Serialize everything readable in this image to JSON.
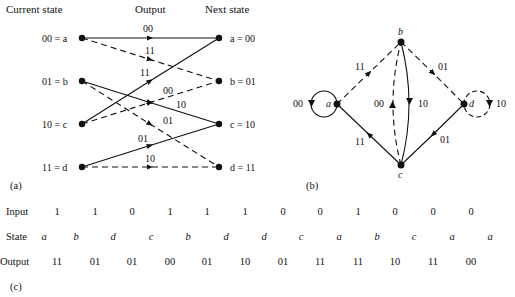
{
  "trellis": {
    "headers": {
      "current": "Current state",
      "output": "Output",
      "next": "Next state"
    },
    "left_states": [
      "00 = a",
      "01 = b",
      "10 = c",
      "11 = d"
    ],
    "right_states": [
      "a = 00",
      "b = 01",
      "c = 10",
      "d = 11"
    ],
    "edges": [
      {
        "from": "a",
        "to": "a",
        "style": "solid",
        "label": "00"
      },
      {
        "from": "a",
        "to": "b",
        "style": "dashed",
        "label": "11"
      },
      {
        "from": "b",
        "to": "c",
        "style": "solid",
        "label": "10"
      },
      {
        "from": "b",
        "to": "d",
        "style": "dashed",
        "label": "01"
      },
      {
        "from": "c",
        "to": "a",
        "style": "solid",
        "label": "11"
      },
      {
        "from": "c",
        "to": "b",
        "style": "dashed",
        "label": "00"
      },
      {
        "from": "d",
        "to": "c",
        "style": "solid",
        "label": "01"
      },
      {
        "from": "d",
        "to": "d",
        "style": "dashed",
        "label": "10"
      }
    ],
    "caption": "(a)"
  },
  "state_diagram": {
    "nodes": [
      "a",
      "b",
      "c",
      "d"
    ],
    "edges": [
      {
        "from": "a",
        "to": "a",
        "style": "solid",
        "label": "00"
      },
      {
        "from": "a",
        "to": "b",
        "style": "dashed",
        "label": "11"
      },
      {
        "from": "b",
        "to": "d",
        "style": "dashed",
        "label": "01"
      },
      {
        "from": "b",
        "to": "c",
        "style": "solid",
        "label": "10"
      },
      {
        "from": "c",
        "to": "b",
        "style": "dashed",
        "label": "00"
      },
      {
        "from": "c",
        "to": "a",
        "style": "solid",
        "label": "11"
      },
      {
        "from": "d",
        "to": "c",
        "style": "solid",
        "label": "01"
      },
      {
        "from": "d",
        "to": "d",
        "style": "dashed",
        "label": "10"
      }
    ],
    "caption": "(b)"
  },
  "sequence": {
    "labels": {
      "input": "Input",
      "state": "State",
      "output": "Output"
    },
    "input": [
      "1",
      "1",
      "0",
      "1",
      "1",
      "1",
      "0",
      "0",
      "1",
      "0",
      "0",
      "0"
    ],
    "state": [
      "a",
      "b",
      "d",
      "c",
      "b",
      "d",
      "d",
      "c",
      "a",
      "b",
      "c",
      "a",
      "a"
    ],
    "output": [
      "11",
      "01",
      "01",
      "00",
      "01",
      "10",
      "01",
      "11",
      "11",
      "10",
      "11",
      "00"
    ],
    "caption": "(c)"
  }
}
